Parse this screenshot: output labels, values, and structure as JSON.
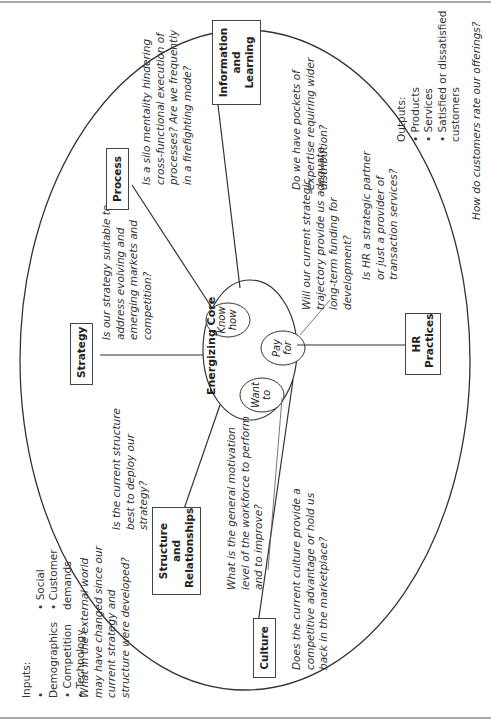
{
  "inputs": {
    "heading": "Inputs:",
    "col1": [
      "Demographics",
      "Competition",
      "Technology"
    ],
    "col2": [
      "Social",
      "Customer demands"
    ],
    "question": "What in the external world may have changed since our current strategy and structure were developed?"
  },
  "outputs": {
    "heading": "Outputs:",
    "items": [
      "Products",
      "Services",
      "Satisfied or dissatisfied customers"
    ],
    "question": "How do customers rate our offerings?"
  },
  "core": {
    "title": "Energizing Core",
    "circles": [
      "Want to",
      "Know how",
      "Pay for"
    ]
  },
  "nodes": {
    "strategy": {
      "label": "Strategy",
      "question": "Is our strategy suitable to address evolving and emerging markets and competition?"
    },
    "process": {
      "label": "Process",
      "question": "Is a silo mentality hindering cross-functional execution of processes? Are we frequently in a firefighting mode?"
    },
    "info": {
      "label": "Information and Learning",
      "question": "Do we have pockets of expertise requiring wider distribution?"
    },
    "hr": {
      "label": "HR Practices",
      "question": "Is HR a strategic partner or just a provider of transaction services?"
    },
    "culture": {
      "label": "Culture",
      "question": "Does the current culture provide a competitive advantage or hold us back in the marketplace?"
    },
    "structure": {
      "label": "Structure and Relationships",
      "question": "Is the current structure best to deploy our strategy?"
    }
  },
  "annotations": {
    "want_to": "What is the general motivation level of the workforce to perform and to improve?",
    "pay_for": "Will our current strategic trajectory provide us adequate long-term funding for development?"
  }
}
